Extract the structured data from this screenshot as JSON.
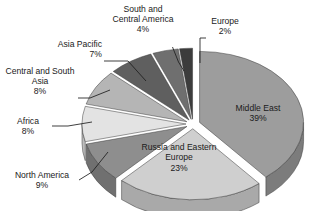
{
  "chart_data": {
    "type": "pie",
    "title": "",
    "subtitle": "",
    "xlabel": "",
    "ylabel": "",
    "units": "percent",
    "legend_position": "none",
    "grid": false,
    "three_d": true,
    "exploded": true,
    "categories": [
      "Middle East",
      "Russia and Eastern Europe",
      "North America",
      "Africa",
      "Central and South Asia",
      "Asia Pacific",
      "South and Central America",
      "Europe"
    ],
    "values": [
      39,
      23,
      9,
      8,
      8,
      7,
      4,
      2
    ],
    "value_labels": [
      "39%",
      "23%",
      "9%",
      "8%",
      "8%",
      "7%",
      "4%",
      "2%"
    ],
    "colors": [
      "#9d9d9d",
      "#cfcfcf",
      "#8e8e8e",
      "#e3e3e3",
      "#b5b5b5",
      "#5f5f5f",
      "#6f6f6f",
      "#3c3c3c"
    ],
    "slices": [
      {
        "name": "Middle East",
        "value": 39,
        "label": "Middle East",
        "pct": "39%",
        "color": "#9d9d9d",
        "side_color": "#7c7c7c"
      },
      {
        "name": "Russia and Eastern Europe",
        "value": 23,
        "label": "Russia and Eastern\nEurope",
        "pct": "23%",
        "color": "#cfcfcf",
        "side_color": "#a9a9a9"
      },
      {
        "name": "North America",
        "value": 9,
        "label": "North America",
        "pct": "9%",
        "color": "#8e8e8e",
        "side_color": "#707070"
      },
      {
        "name": "Africa",
        "value": 8,
        "label": "Africa",
        "pct": "8%",
        "color": "#e3e3e3",
        "side_color": "#bdbdbd"
      },
      {
        "name": "Central and South Asia",
        "value": 8,
        "label": "Central and South\nAsia",
        "pct": "8%",
        "color": "#b5b5b5",
        "side_color": "#909090"
      },
      {
        "name": "Asia Pacific",
        "value": 7,
        "label": "Asia Pacific",
        "pct": "7%",
        "color": "#5f5f5f",
        "side_color": "#4b4b4b"
      },
      {
        "name": "South and Central America",
        "value": 4,
        "label": "South and\nCentral America",
        "pct": "4%",
        "color": "#6f6f6f",
        "side_color": "#585858"
      },
      {
        "name": "Europe",
        "value": 2,
        "label": "Europe",
        "pct": "2%",
        "color": "#3c3c3c",
        "side_color": "#303030"
      }
    ]
  },
  "labels": {
    "south_central_america": {
      "line1": "South and",
      "line2": "Central America",
      "pct": "4%"
    },
    "europe": {
      "line1": "Europe",
      "pct": "2%"
    },
    "asia_pacific": {
      "line1": "Asia Pacific",
      "pct": "7%"
    },
    "central_south_asia": {
      "line1": "Central and South",
      "line2": "Asia",
      "pct": "8%"
    },
    "africa": {
      "line1": "Africa",
      "pct": "8%"
    },
    "north_america": {
      "line1": "North America",
      "pct": "9%"
    },
    "middle_east": {
      "line1": "Middle East",
      "pct": "39%"
    },
    "russia_eastern_europe": {
      "line1": "Russia and Eastern",
      "line2": "Europe",
      "pct": "23%"
    }
  },
  "style": {
    "background": "#ffffff",
    "text_color": "#1b1b1b",
    "leader_color": "#1d1d1d"
  }
}
